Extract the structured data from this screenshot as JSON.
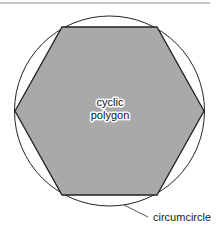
{
  "diagram": {
    "labels": {
      "polygon_line1": "cyclic",
      "polygon_line2": "polygon",
      "circle": "circumcircle"
    },
    "colors": {
      "polygon_fill": "#a9a9a9",
      "stroke": "#222222",
      "top_rule": "#8a8a8a",
      "leader": "#555555"
    }
  }
}
